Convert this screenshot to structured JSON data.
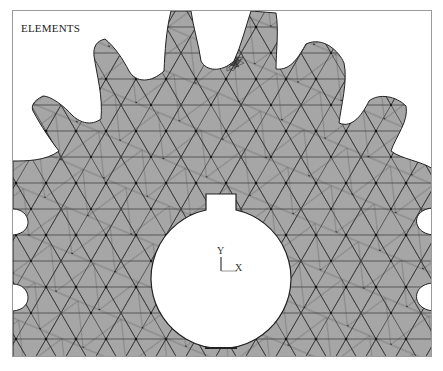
{
  "viewport": {
    "title": "ELEMENTS",
    "triad": {
      "x_label": "X",
      "y_label": "Y"
    }
  },
  "model": {
    "description": "gear cross-section triangular mesh",
    "fill_color": "#a6a6a6",
    "edge_color": "#2f2f2f",
    "background": "#ffffff"
  }
}
